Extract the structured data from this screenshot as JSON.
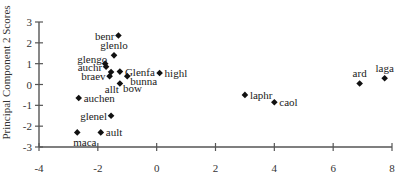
{
  "chart_data": {
    "type": "scatter",
    "title": "",
    "xlabel": "",
    "ylabel": "Principal Component 2 Scores",
    "xlim": [
      -4,
      8
    ],
    "ylim": [
      -3,
      3
    ],
    "x_ticks": [
      -4,
      -2,
      0,
      2,
      4,
      6,
      8
    ],
    "y_ticks": [
      -3,
      -2,
      -1,
      0,
      1,
      2,
      3
    ],
    "grid": false,
    "legend": null,
    "marker": "diamond",
    "points": [
      {
        "label": "benr",
        "x": -1.3,
        "y": 2.35,
        "label_pos": "left"
      },
      {
        "label": "glenlo",
        "x": -1.45,
        "y": 1.4,
        "label_pos": "above"
      },
      {
        "label": "glengo",
        "x": -1.75,
        "y": 1.0,
        "label_pos": "left-above"
      },
      {
        "label": "auchr",
        "x": -1.72,
        "y": 0.85,
        "label_pos": "left"
      },
      {
        "label": "",
        "x": -1.55,
        "y": 0.6,
        "label_pos": "none"
      },
      {
        "label": "Glenfa",
        "x": -1.25,
        "y": 0.62,
        "label_pos": "right"
      },
      {
        "label": "braev",
        "x": -1.6,
        "y": 0.4,
        "label_pos": "left"
      },
      {
        "label": "bunna",
        "x": -1.0,
        "y": 0.4,
        "label_pos": "right-below"
      },
      {
        "label": "highl",
        "x": 0.1,
        "y": 0.55,
        "label_pos": "right"
      },
      {
        "label": "allt",
        "x": -1.25,
        "y": 0.05,
        "label_pos": "left-below"
      },
      {
        "label": "bow",
        "x": -1.25,
        "y": 0.05,
        "label_pos": "right-below"
      },
      {
        "label": "auchen",
        "x": -2.65,
        "y": -0.65,
        "label_pos": "right"
      },
      {
        "label": "glenel",
        "x": -1.55,
        "y": -1.5,
        "label_pos": "left"
      },
      {
        "label": "ault",
        "x": -1.9,
        "y": -2.3,
        "label_pos": "right"
      },
      {
        "label": "maca",
        "x": -2.7,
        "y": -2.3,
        "label_pos": "below"
      },
      {
        "label": "laphr",
        "x": 3.0,
        "y": -0.5,
        "label_pos": "right"
      },
      {
        "label": "caol",
        "x": 4.0,
        "y": -0.85,
        "label_pos": "right"
      },
      {
        "label": "ard",
        "x": 6.9,
        "y": 0.05,
        "label_pos": "above"
      },
      {
        "label": "laga",
        "x": 7.75,
        "y": 0.3,
        "label_pos": "above"
      }
    ]
  },
  "layout": {
    "plot_left": 39,
    "plot_right": 392,
    "plot_top": 22,
    "plot_bottom": 147,
    "colors": {
      "axis": "#555555",
      "marker": "#111111",
      "text": "#1a1a1a"
    }
  }
}
